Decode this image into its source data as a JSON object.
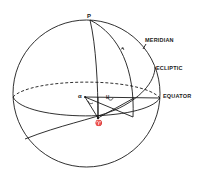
{
  "diagram": {
    "labels": {
      "pole": "P",
      "meridian": "MERIDIAN",
      "ecliptic": "ECLIPTIC",
      "equator": "EQUATOR",
      "right_ascension": "α",
      "hour_angle": "H",
      "vernal_equinox": "♈"
    },
    "colors": {
      "stroke": "#1a1a1a",
      "background": "#ffffff"
    }
  }
}
